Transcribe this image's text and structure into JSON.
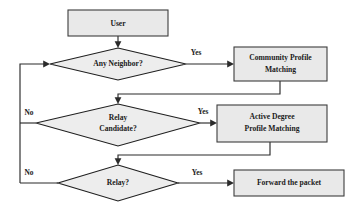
{
  "diagram": {
    "type": "flowchart",
    "colors": {
      "shape_fill": "#e9e9e9",
      "diamond_fill": "#ededed",
      "shape_border": "#3d3d3d",
      "diamond_border": "#1f1f1f",
      "connector": "#2b2b2b",
      "text": "#1a1a1a",
      "background": "#ffffff"
    },
    "nodes": [
      {
        "id": "user",
        "shape": "rectangle",
        "lines": [
          "User"
        ]
      },
      {
        "id": "any-neighbor",
        "shape": "diamond",
        "lines": [
          "Any Neighbor?"
        ]
      },
      {
        "id": "community-profile-matching",
        "shape": "rectangle",
        "lines": [
          "Community Profile",
          "Matching"
        ]
      },
      {
        "id": "relay-candidate",
        "shape": "diamond",
        "lines": [
          "Relay",
          "Candidate?"
        ]
      },
      {
        "id": "active-degree-profile-matching",
        "shape": "rectangle",
        "lines": [
          "Active Degree",
          "Profile Matching"
        ]
      },
      {
        "id": "relay",
        "shape": "diamond",
        "lines": [
          "Relay?"
        ]
      },
      {
        "id": "forward-the-packet",
        "shape": "rectangle",
        "lines": [
          "Forward the packet"
        ]
      }
    ],
    "edge_labels": {
      "yes_any_neighbor": "Yes",
      "yes_relay_candidate": "Yes",
      "yes_relay": "Yes",
      "no_relay_candidate": "No",
      "no_relay": "No"
    }
  }
}
